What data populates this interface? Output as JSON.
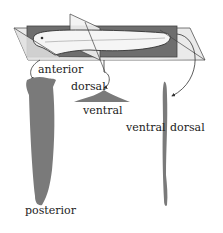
{
  "diagram": {
    "colors": {
      "plane_dark": "#707070",
      "plane_light": "#e6e6e6",
      "section_fill": "#7a7a7a",
      "outline": "#333333",
      "fish_fill": "#f4f4f4"
    },
    "labels": {
      "anterior": "anterior",
      "posterior": "posterior",
      "dorsal_mid": "dorsal",
      "ventral_mid": "ventral",
      "ventral_right": "ventral",
      "dorsal_right": "dorsal"
    },
    "sections": [
      {
        "name": "frontal-section",
        "orientation": "anterior-posterior"
      },
      {
        "name": "transverse-section",
        "orientation": "dorsal-ventral"
      },
      {
        "name": "sagittal-section",
        "orientation": "ventral-dorsal"
      }
    ]
  }
}
